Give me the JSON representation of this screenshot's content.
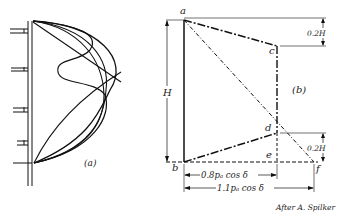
{
  "figure": {
    "panel_a": {
      "label": "(a)",
      "description": "Pressure distribution curves on braced sheeting wall"
    },
    "panel_b": {
      "label": "(b)",
      "points": {
        "a": "a",
        "b": "b",
        "c": "c",
        "d": "d",
        "e": "e",
        "f": "f"
      },
      "dimensions": {
        "height": "H",
        "top_offset": "0.2H",
        "bottom_offset": "0.2H",
        "inner_width": "0.8pₐ cos δ",
        "outer_width": "1.1pₐ cos δ"
      }
    },
    "credit": "After A. Spilker"
  }
}
